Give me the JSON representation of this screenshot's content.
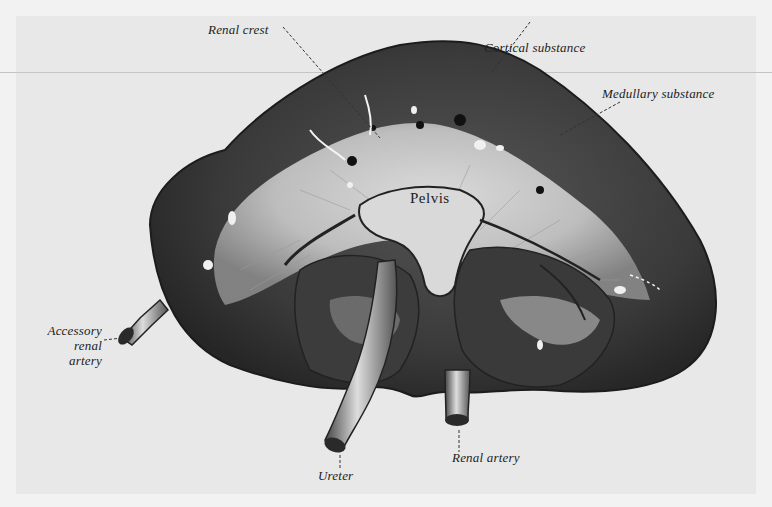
{
  "figure": {
    "colors": {
      "background": "#f2f2f2",
      "plate": "#e8e8e8",
      "cortex": "#3a3a3a",
      "medulla": "#bdbdbd",
      "ink": "#222222"
    },
    "labels": {
      "renal_crest": "Renal crest",
      "cortical_substance": "Cortical substance",
      "medullary_substance": "Medullary substance",
      "pelvis": "Pelvis",
      "accessory_renal_artery_line1": "Accessory",
      "accessory_renal_artery_line2": "renal",
      "accessory_renal_artery_line3": "artery",
      "ureter": "Ureter",
      "renal_artery": "Renal artery"
    }
  }
}
